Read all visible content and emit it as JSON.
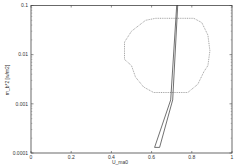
{
  "chart_data": {
    "type": "line",
    "title": "",
    "xlabel": "U_ma0",
    "ylabel": "m_b*2 [w/m2]",
    "xlim": [
      0,
      1
    ],
    "ylim": [
      0.0001,
      0.1
    ],
    "yscale": "log",
    "grid": false,
    "legend": null,
    "x_ticks": [
      "0",
      "0.2",
      "0.4",
      "0.6",
      "0.8",
      "1"
    ],
    "y_ticks": [
      "0.1",
      "0.01",
      "0.001",
      "0.0001"
    ],
    "series": [
      {
        "name": "boundary-region",
        "style": "dotted",
        "color": "#999999",
        "closed": true,
        "points": [
          [
            0.5,
            0.03
          ],
          [
            0.57,
            0.05
          ],
          [
            0.62,
            0.055
          ],
          [
            0.81,
            0.055
          ],
          [
            0.85,
            0.045
          ],
          [
            0.88,
            0.025
          ],
          [
            0.89,
            0.012
          ],
          [
            0.88,
            0.006
          ],
          [
            0.86,
            0.0045
          ],
          [
            0.83,
            0.0025
          ],
          [
            0.78,
            0.0017
          ],
          [
            0.61,
            0.0017
          ],
          [
            0.56,
            0.0022
          ],
          [
            0.52,
            0.0035
          ],
          [
            0.5,
            0.006
          ],
          [
            0.465,
            0.008
          ],
          [
            0.465,
            0.018
          ]
        ]
      },
      {
        "name": "narrow-loop",
        "style": "solid",
        "color": "#333333",
        "closed": true,
        "points": [
          [
            0.725,
            0.1
          ],
          [
            0.73,
            0.1
          ],
          [
            0.705,
            0.0012
          ],
          [
            0.64,
            0.00013
          ],
          [
            0.615,
            0.00013
          ],
          [
            0.695,
            0.0012
          ]
        ]
      }
    ]
  }
}
